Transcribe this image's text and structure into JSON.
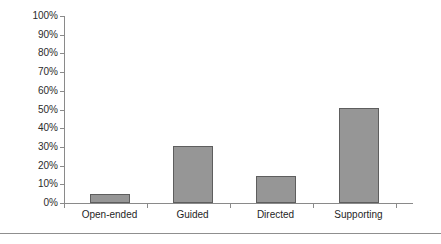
{
  "chart_data": {
    "type": "bar",
    "title": "",
    "subtitle": "",
    "xlabel": "",
    "ylabel": "",
    "categories": [
      "Open-ended",
      "Guided",
      "Directed",
      "Supporting"
    ],
    "values": [
      5,
      30.5,
      14.5,
      51
    ],
    "value_labels": [
      "5%",
      "30.5%",
      "14.5%",
      "51%"
    ],
    "ylim": [
      0,
      100
    ],
    "y_tick_labels": [
      "100%",
      "90%",
      "80%",
      "70%",
      "60%",
      "50%",
      "40%",
      "30%",
      "20%",
      "10%",
      "0%"
    ],
    "y_tick_values": [
      100,
      90,
      80,
      70,
      60,
      50,
      40,
      30,
      20,
      10,
      0
    ],
    "grid": false,
    "legend": null,
    "legend_position": "none",
    "annotations": [],
    "series": [
      {
        "name": "Percentage",
        "values": [
          5,
          30.5,
          14.5,
          51
        ]
      }
    ],
    "colors": {
      "bar_fill": "#969696",
      "bar_border": "#5e5e5e",
      "axis": "#8a8a8a",
      "text": "#1f1f1f",
      "background": "#ffffff",
      "rule": "#8f8f8f"
    }
  }
}
